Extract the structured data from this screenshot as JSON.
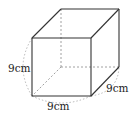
{
  "figure": {
    "type": "cube",
    "labels": {
      "height": "9cm",
      "width": "9cm",
      "depth": "9cm"
    },
    "colors": {
      "edge": "#333333",
      "hidden_edge": "#888888",
      "arc": "#999999"
    }
  }
}
